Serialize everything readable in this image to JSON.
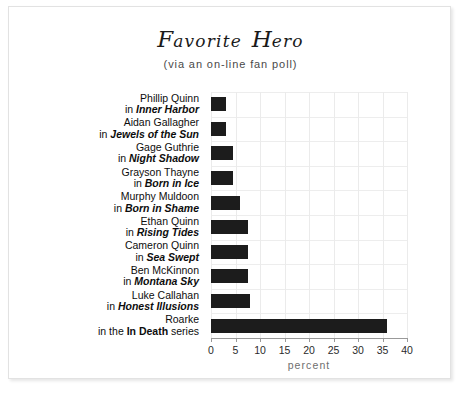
{
  "chart_data": {
    "type": "bar",
    "orientation": "horizontal",
    "subtitle": "(via an on-line fan poll)",
    "xlabel": "percent",
    "ylabel": "",
    "xlim": [
      0,
      40
    ],
    "xticks": [
      0,
      5,
      10,
      15,
      20,
      25,
      30,
      35,
      40
    ],
    "grid": true,
    "legend": null,
    "bar_color": "#1c1c1c",
    "categories": [
      "Phillip Quinn in Inner Harbor",
      "Aidan Gallagher in Jewels of the Sun",
      "Gage Guthrie in Night Shadow",
      "Grayson Thayne in Born in Ice",
      "Murphy Muldoon in Born in Shame",
      "Ethan Quinn in Rising Tides",
      "Cameron Quinn in Sea Swept",
      "Ben McKinnon in Montana Sky",
      "Luke Callahan in Honest Illusions",
      "Roarke in the In Death series"
    ],
    "values": [
      3,
      3,
      4.5,
      4.5,
      6,
      7.5,
      7.5,
      7.5,
      8,
      36
    ],
    "items": [
      {
        "character": "Phillip Quinn",
        "prefix": "in ",
        "work": "Inner Harbor",
        "suffix": "",
        "work_style": "italic",
        "value": 3
      },
      {
        "character": "Aidan Gallagher",
        "prefix": "in ",
        "work": "Jewels of the Sun",
        "suffix": "",
        "work_style": "italic",
        "value": 3
      },
      {
        "character": "Gage Guthrie",
        "prefix": "in ",
        "work": "Night Shadow",
        "suffix": "",
        "work_style": "italic",
        "value": 4.5
      },
      {
        "character": "Grayson Thayne",
        "prefix": "in ",
        "work": "Born in Ice",
        "suffix": "",
        "work_style": "italic",
        "value": 4.5
      },
      {
        "character": "Murphy Muldoon",
        "prefix": "in ",
        "work": "Born in Shame",
        "suffix": "",
        "work_style": "italic",
        "value": 6
      },
      {
        "character": "Ethan Quinn",
        "prefix": "in ",
        "work": "Rising Tides",
        "suffix": "",
        "work_style": "italic",
        "value": 7.5
      },
      {
        "character": "Cameron Quinn",
        "prefix": "in ",
        "work": "Sea Swept",
        "suffix": "",
        "work_style": "italic",
        "value": 7.5
      },
      {
        "character": "Ben McKinnon",
        "prefix": "in ",
        "work": "Montana Sky",
        "suffix": "",
        "work_style": "italic",
        "value": 7.5
      },
      {
        "character": "Luke Callahan",
        "prefix": "in ",
        "work": "Honest Illusions",
        "suffix": "",
        "work_style": "italic",
        "value": 8
      },
      {
        "character": "Roarke",
        "prefix": "in the ",
        "work": "In Death",
        "suffix": " series",
        "work_style": "upright",
        "value": 36
      }
    ]
  }
}
